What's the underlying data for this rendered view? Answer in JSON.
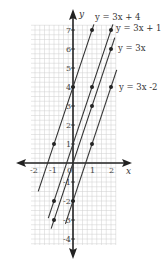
{
  "chart_data": {
    "type": "line",
    "title": "",
    "xlabel": "x",
    "ylabel": "y",
    "xlim": [
      -2.2,
      2.3
    ],
    "ylim": [
      -4.3,
      7.3
    ],
    "grid": true,
    "x_ticks": [
      -2,
      -1,
      0,
      1,
      2
    ],
    "y_ticks": [
      -4,
      -3,
      -2,
      -1,
      1,
      2,
      3,
      4,
      5,
      6,
      7
    ],
    "series": [
      {
        "name": "y = 3x + 4",
        "slope": 3,
        "intercept": 4,
        "x_range": [
          -1.83,
          1.1
        ],
        "points": [
          [
            -1,
            1
          ],
          [
            0,
            4
          ],
          [
            1,
            7
          ]
        ]
      },
      {
        "name": "y = 3x + 1",
        "slope": 3,
        "intercept": 1,
        "x_range": [
          -1.3,
          2.1
        ],
        "points": [
          [
            -1,
            -2
          ],
          [
            1,
            4
          ],
          [
            2,
            7
          ]
        ]
      },
      {
        "name": "y = 3x",
        "slope": 3,
        "intercept": 0,
        "x_range": [
          -1.15,
          2.2
        ],
        "points": [
          [
            -1,
            -3
          ],
          [
            1,
            3
          ],
          [
            2,
            6
          ]
        ]
      },
      {
        "name": "y = 3x -2",
        "slope": 3,
        "intercept": -2,
        "x_range": [
          -0.4,
          2.3
        ],
        "points": [
          [
            0,
            -2
          ],
          [
            1,
            1
          ],
          [
            2,
            4
          ]
        ]
      }
    ],
    "labels": [
      {
        "text": "y = 3x + 4",
        "x": 95,
        "y": 20
      },
      {
        "text": "y = 3x + 1",
        "x": 116,
        "y": 31
      },
      {
        "text": "y = 3x",
        "x": 118,
        "y": 51
      },
      {
        "text": "y = 3x -2",
        "x": 119,
        "y": 90
      }
    ]
  },
  "colors": {
    "grid": "#cfcfcf",
    "axis": "#222222",
    "line": "#333333",
    "point": "#222222"
  },
  "layout": {
    "origin_px": [
      73,
      163
    ],
    "unit_px": 19,
    "grid_box": [
      31,
      25,
      116,
      245
    ]
  }
}
